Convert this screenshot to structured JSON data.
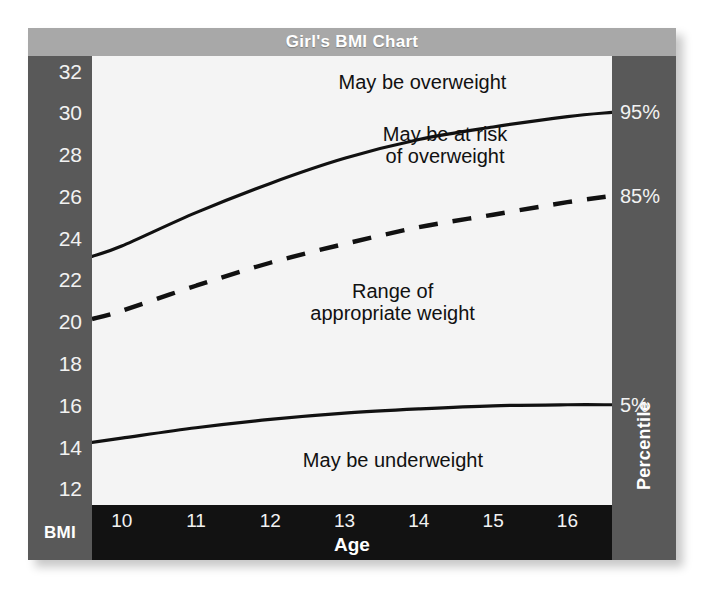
{
  "chart_data": {
    "type": "line",
    "title": "Girl's BMI Chart",
    "xlabel": "Age",
    "ylabel": "BMI",
    "y2label": "Percentile",
    "xlim": [
      9.6,
      16.6
    ],
    "ylim": [
      11.2,
      32.7
    ],
    "xticks": [
      10,
      11,
      12,
      13,
      14,
      15,
      16
    ],
    "xticklabels": [
      "10",
      "11",
      "12",
      "13",
      "14",
      "15",
      "16"
    ],
    "yticks": [
      12,
      14,
      16,
      18,
      20,
      22,
      24,
      26,
      28,
      30,
      32
    ],
    "yticklabels": [
      "12",
      "14",
      "16",
      "18",
      "20",
      "22",
      "24",
      "26",
      "28",
      "30",
      "32"
    ],
    "y2ticks": [
      30.0,
      26.0,
      16.0
    ],
    "y2ticklabels": [
      "95%",
      "85%",
      "5%"
    ],
    "grid": false,
    "legend": "none",
    "x": [
      9.6,
      10,
      11,
      12,
      13,
      14,
      15,
      16,
      16.6
    ],
    "series": [
      {
        "name": "95th percentile",
        "style": "solid",
        "values": [
          23.1,
          23.6,
          25.2,
          26.6,
          27.8,
          28.7,
          29.3,
          29.8,
          30.0
        ]
      },
      {
        "name": "85th percentile",
        "style": "dashed",
        "values": [
          20.1,
          20.5,
          21.7,
          22.8,
          23.7,
          24.5,
          25.1,
          25.7,
          26.0
        ]
      },
      {
        "name": "5th percentile",
        "style": "solid",
        "values": [
          14.2,
          14.4,
          14.9,
          15.3,
          15.6,
          15.8,
          15.95,
          16.0,
          16.0
        ]
      }
    ],
    "annotations": [
      {
        "id": "may-be-overweight",
        "text": "May be overweight",
        "x": 14.05,
        "y": 31.4
      },
      {
        "id": "may-be-at-risk",
        "text": "May be at risk\nof overweight",
        "x": 14.35,
        "y": 28.4
      },
      {
        "id": "range-appropriate-weight",
        "text": "Range of\nappropriate weight",
        "x": 13.65,
        "y": 20.9
      },
      {
        "id": "may-be-underweight",
        "text": "May be underweight",
        "x": 13.65,
        "y": 13.3
      }
    ],
    "colors": {
      "title_banner": "#a8a8a8",
      "axis_bar": "#595959",
      "x_axis_bar": "#121212",
      "plot_background": "#f4f4f4",
      "curve": "#111111",
      "axis_text": "#f2f2f2",
      "annotation_text": "#111111"
    }
  },
  "title": {
    "text": "Girl's BMI Chart"
  },
  "axes": {
    "y_label": "BMI",
    "x_label": "Age",
    "y2_label": "Percentile"
  }
}
